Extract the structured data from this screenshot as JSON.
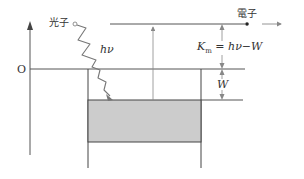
{
  "diagram": {
    "labels": {
      "photon": "光子",
      "photon_energy": "hν",
      "electron": "電子",
      "origin": "O",
      "kinetic_energy_lhs": "K",
      "kinetic_energy_sub": "m",
      "kinetic_energy_rhs": " = hν−W",
      "work_function": "W"
    },
    "colors": {
      "line": "#444444",
      "thin_line": "#888888",
      "fill_band": "#cccccc",
      "text": "#333333"
    }
  }
}
